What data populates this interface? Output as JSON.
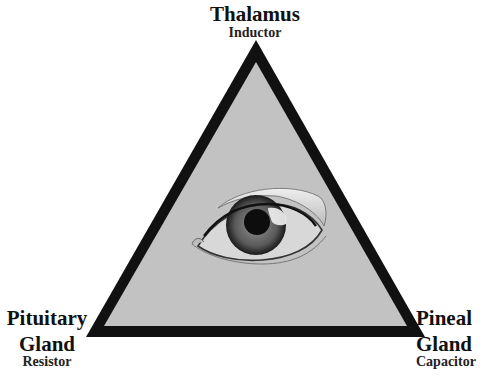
{
  "diagram": {
    "type": "triangle",
    "colors": {
      "outline": "#111111",
      "fill": "#c2c2c2",
      "background": "#ffffff",
      "iris": "#4a4a4a",
      "pupil": "#0d0d0d"
    },
    "center_image": "eye",
    "vertices": {
      "top": {
        "title": "Thalamus",
        "subtitle": "Inductor"
      },
      "bottom_left": {
        "title_line1": "Pituitary",
        "title_line2": "Gland",
        "subtitle": "Resistor"
      },
      "bottom_right": {
        "title_line1": "Pineal",
        "title_line2": "Gland",
        "subtitle": "Capacitor"
      }
    }
  }
}
